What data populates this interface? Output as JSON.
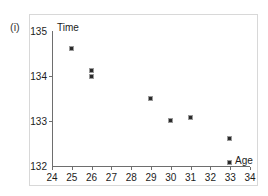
{
  "top_cut_text": "",
  "part_label": "(i)",
  "chart_data": {
    "type": "scatter",
    "title": "",
    "xlabel": "Age",
    "ylabel": "Time",
    "xlim": [
      24,
      34
    ],
    "ylim": [
      132,
      135
    ],
    "xticks": [
      24,
      25,
      26,
      27,
      28,
      29,
      30,
      31,
      32,
      33,
      34
    ],
    "xtick_labels": [
      "24",
      "25",
      "26",
      "27",
      "28",
      "29",
      "30",
      "31",
      "32",
      "33",
      "34"
    ],
    "yticks": [
      132,
      133,
      134,
      135
    ],
    "ytick_labels": [
      "132",
      "133",
      "134",
      "135"
    ],
    "grid": false,
    "legend": false,
    "marker": "square",
    "marker_color": "#2a2a2a",
    "points": [
      {
        "x": 25,
        "y": 134.6
      },
      {
        "x": 26,
        "y": 134.12
      },
      {
        "x": 26,
        "y": 133.98
      },
      {
        "x": 29,
        "y": 133.5
      },
      {
        "x": 30,
        "y": 133.0
      },
      {
        "x": 31,
        "y": 133.07
      },
      {
        "x": 33,
        "y": 132.6
      },
      {
        "x": 33,
        "y": 132.07
      }
    ]
  }
}
